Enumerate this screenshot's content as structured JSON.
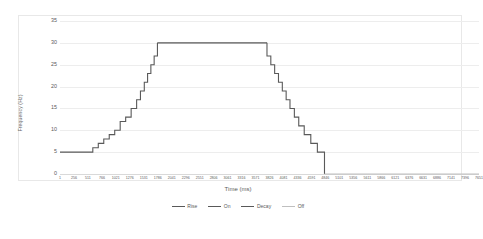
{
  "chart_data": {
    "type": "line",
    "title": "",
    "xlabel": "Time (ms)",
    "ylabel": "Frequency (Hz)",
    "xlim": [
      1,
      7651
    ],
    "ylim": [
      0,
      35
    ],
    "grid": true,
    "legend_position": "bottom",
    "y_ticks": [
      0,
      5,
      10,
      15,
      20,
      25,
      30,
      35
    ],
    "x_ticks": [
      1,
      256,
      511,
      766,
      1021,
      1276,
      1531,
      1786,
      2041,
      2296,
      2551,
      2806,
      3061,
      3316,
      3571,
      3826,
      4081,
      4336,
      4591,
      4846,
      5101,
      5356,
      5611,
      5866,
      6121,
      6376,
      6631,
      6886,
      7141,
      7396,
      7651
    ],
    "series": [
      {
        "name": "Rise",
        "color": "#595959",
        "points": [
          [
            1,
            5
          ],
          [
            600,
            5
          ],
          [
            600,
            6
          ],
          [
            700,
            6
          ],
          [
            700,
            7
          ],
          [
            800,
            7
          ],
          [
            800,
            8
          ],
          [
            900,
            8
          ],
          [
            900,
            9
          ],
          [
            1000,
            9
          ],
          [
            1000,
            10
          ],
          [
            1100,
            10
          ],
          [
            1100,
            12
          ],
          [
            1200,
            12
          ],
          [
            1200,
            13
          ],
          [
            1300,
            13
          ],
          [
            1300,
            15
          ],
          [
            1400,
            15
          ],
          [
            1400,
            17
          ],
          [
            1470,
            17
          ],
          [
            1470,
            19
          ],
          [
            1540,
            19
          ],
          [
            1540,
            21
          ],
          [
            1600,
            21
          ],
          [
            1600,
            23
          ],
          [
            1660,
            23
          ],
          [
            1660,
            25
          ],
          [
            1720,
            25
          ],
          [
            1720,
            27
          ],
          [
            1780,
            27
          ],
          [
            1780,
            30
          ]
        ]
      },
      {
        "name": "On",
        "color": "#595959",
        "points": [
          [
            1780,
            30
          ],
          [
            3780,
            30
          ]
        ]
      },
      {
        "name": "Decay",
        "color": "#595959",
        "points": [
          [
            3780,
            30
          ],
          [
            3780,
            27
          ],
          [
            3850,
            27
          ],
          [
            3850,
            25
          ],
          [
            3920,
            25
          ],
          [
            3920,
            23
          ],
          [
            3990,
            23
          ],
          [
            3990,
            21
          ],
          [
            4060,
            21
          ],
          [
            4060,
            19
          ],
          [
            4130,
            19
          ],
          [
            4130,
            17
          ],
          [
            4200,
            17
          ],
          [
            4200,
            15
          ],
          [
            4280,
            15
          ],
          [
            4280,
            13
          ],
          [
            4360,
            13
          ],
          [
            4360,
            11
          ],
          [
            4460,
            11
          ],
          [
            4460,
            9
          ],
          [
            4580,
            9
          ],
          [
            4580,
            7
          ],
          [
            4700,
            7
          ],
          [
            4700,
            5
          ],
          [
            4830,
            5
          ],
          [
            4830,
            0
          ]
        ]
      },
      {
        "name": "Off",
        "color": "#bfbfbf",
        "points": [
          [
            4830,
            0
          ],
          [
            7651,
            0
          ]
        ]
      }
    ]
  },
  "legend": {
    "items": [
      {
        "label": "Rise",
        "color": "#595959"
      },
      {
        "label": "On",
        "color": "#595959"
      },
      {
        "label": "Decay",
        "color": "#595959"
      },
      {
        "label": "Off",
        "color": "#bfbfbf"
      }
    ]
  },
  "colors": {
    "grid": "#ededed",
    "border": "#e8e8e8",
    "axis_text": "#5a5a5a",
    "background": "#ffffff"
  }
}
